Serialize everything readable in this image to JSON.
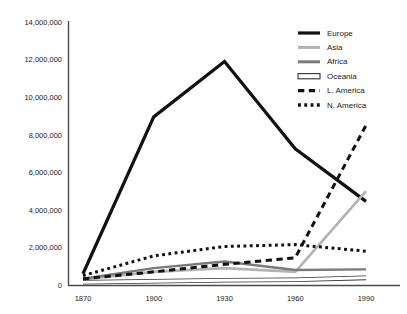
{
  "chart_data": {
    "type": "line",
    "title": "",
    "xlabel": "",
    "ylabel": "",
    "x": [
      1870,
      1900,
      1930,
      1960,
      1990
    ],
    "xtick_labels": [
      "1870",
      "1900",
      "1930",
      "1960",
      "1990"
    ],
    "ytick_labels": [
      "0",
      "2,000,000",
      "4,000,000",
      "6,000,000",
      "8,000,000",
      "10,000,000",
      "12,000,000",
      "14,000,000"
    ],
    "ytick_values": [
      0,
      2000000,
      4000000,
      6000000,
      8000000,
      10000000,
      12000000,
      14000000
    ],
    "ylim": [
      0,
      14000000
    ],
    "xlim": [
      1870,
      1990
    ],
    "grid": false,
    "legend_position": "top-right",
    "series": [
      {
        "name": "Europe",
        "color": "#111111",
        "style": "solid",
        "width": 3.2,
        "values": [
          600000,
          8950000,
          11900000,
          7250000,
          4450000
        ]
      },
      {
        "name": "Asia",
        "color": "#b3b3b3",
        "style": "solid",
        "width": 2.6,
        "values": [
          300000,
          700000,
          900000,
          700000,
          5000000
        ]
      },
      {
        "name": "Africa",
        "color": "#7a7a7a",
        "style": "solid",
        "width": 2.4,
        "values": [
          330000,
          900000,
          1250000,
          800000,
          830000
        ]
      },
      {
        "name": "Oceania",
        "color": "#ffffff",
        "outline": "#333333",
        "style": "outline",
        "width": 3.0,
        "values": [
          150000,
          200000,
          250000,
          280000,
          380000
        ]
      },
      {
        "name": "L. America",
        "color": "#111111",
        "style": "dashed",
        "width": 3.0,
        "values": [
          330000,
          700000,
          1100000,
          1450000,
          8500000
        ]
      },
      {
        "name": "N. America",
        "color": "#111111",
        "style": "dotted",
        "width": 3.0,
        "values": [
          500000,
          1550000,
          2050000,
          2150000,
          1800000
        ]
      }
    ]
  }
}
